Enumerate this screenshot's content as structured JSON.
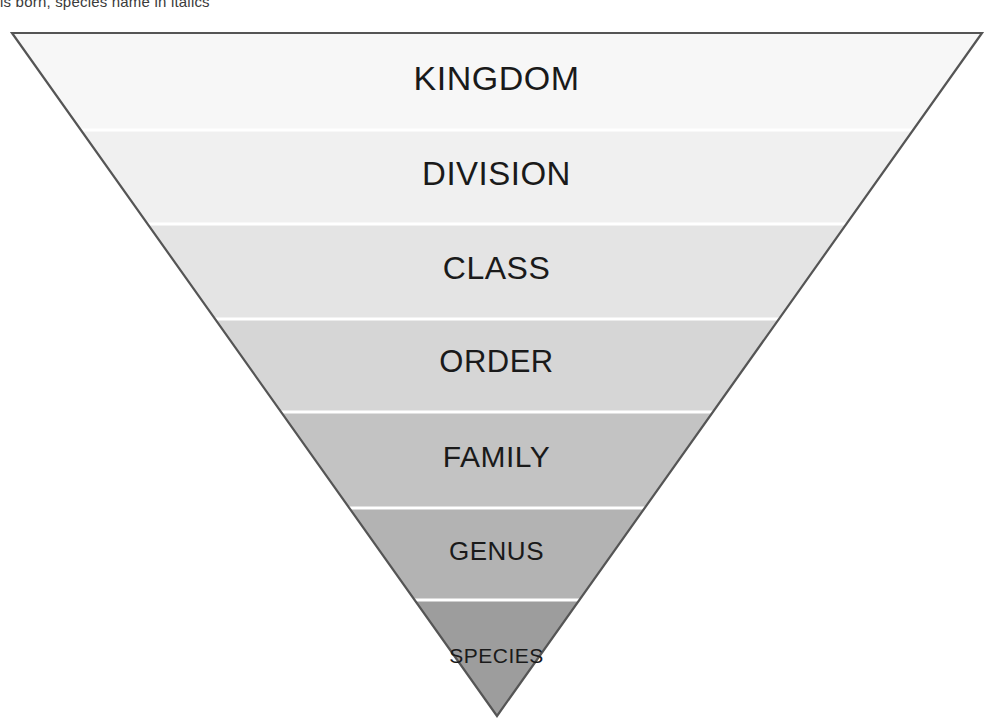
{
  "page": {
    "top_caption": "is born, species name in italics"
  },
  "diagram": {
    "type": "inverted-pyramid",
    "orientation": "inverted",
    "outline_color": "#555555",
    "divider_color": "#ffffff",
    "text_color": "#1a1a1a",
    "background": "#ffffff",
    "apex": {
      "x": 497,
      "y": 716
    },
    "top_left": {
      "x": 12,
      "y": 33
    },
    "top_right": {
      "x": 982,
      "y": 33
    },
    "levels": [
      {
        "label": "KINGDOM",
        "rank": 1,
        "color": "#f7f7f7",
        "y_top": 33,
        "y_bottom": 130,
        "font_size": 34
      },
      {
        "label": "DIVISION",
        "rank": 2,
        "color": "#f0f0f0",
        "y_top": 130,
        "y_bottom": 224,
        "font_size": 33
      },
      {
        "label": "CLASS",
        "rank": 3,
        "color": "#e4e4e4",
        "y_top": 224,
        "y_bottom": 319,
        "font_size": 32
      },
      {
        "label": "ORDER",
        "rank": 4,
        "color": "#d6d6d6",
        "y_top": 319,
        "y_bottom": 412,
        "font_size": 31
      },
      {
        "label": "FAMILY",
        "rank": 5,
        "color": "#c3c3c3",
        "y_top": 412,
        "y_bottom": 508,
        "font_size": 30
      },
      {
        "label": "GENUS",
        "rank": 6,
        "color": "#b3b3b3",
        "y_top": 508,
        "y_bottom": 600,
        "font_size": 26
      },
      {
        "label": "SPECIES",
        "rank": 7,
        "color": "#9d9d9d",
        "y_top": 600,
        "y_bottom": 716,
        "font_size": 21
      }
    ]
  }
}
